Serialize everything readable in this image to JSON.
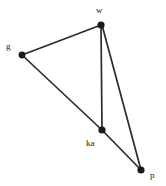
{
  "diagram": {
    "width": 166,
    "height": 186,
    "background_color": "#ffffff",
    "edge_color": "#2b2b2b",
    "node_color": "#1a1a1a",
    "label_color": "#1a1a1a"
  },
  "nodes": [
    {
      "id": "g",
      "label": "g",
      "x": 22,
      "y": 55,
      "r": 3.4,
      "label_x": 6,
      "label_y": 42
    },
    {
      "id": "w",
      "label": "w",
      "x": 101,
      "y": 25,
      "r": 3.6,
      "label_x": 96,
      "label_y": 6
    },
    {
      "id": "ka",
      "label": "ka",
      "x": 102,
      "y": 130,
      "r": 3.6,
      "label_x": 86,
      "label_y": 139
    },
    {
      "id": "p",
      "label": "p",
      "x": 141,
      "y": 170,
      "r": 3.6,
      "label_x": 150,
      "label_y": 171
    }
  ],
  "edges": [
    {
      "id": "g-w",
      "from": "g",
      "to": "w",
      "x1": 22,
      "y1": 55,
      "x2": 101,
      "y2": 25
    },
    {
      "id": "g-ka",
      "from": "g",
      "to": "ka",
      "x1": 22,
      "y1": 55,
      "x2": 102,
      "y2": 130
    },
    {
      "id": "w-ka",
      "from": "w",
      "to": "ka",
      "x1": 101,
      "y1": 25,
      "x2": 102,
      "y2": 130
    },
    {
      "id": "w-p",
      "from": "w",
      "to": "p",
      "x1": 102,
      "y1": 25,
      "x2": 141,
      "y2": 170
    },
    {
      "id": "ka-p",
      "from": "ka",
      "to": "p",
      "x1": 102,
      "y1": 130,
      "x2": 141,
      "y2": 170
    }
  ]
}
